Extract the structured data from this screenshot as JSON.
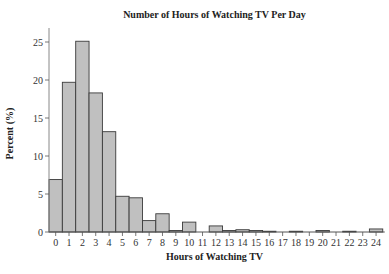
{
  "chart_data": {
    "type": "bar",
    "title": "Number of Hours of Watching TV Per Day",
    "xlabel": "Hours of Watching TV",
    "ylabel": "Percent (%)",
    "categories": [
      "0",
      "1",
      "2",
      "3",
      "4",
      "5",
      "6",
      "7",
      "8",
      "9",
      "10",
      "11",
      "12",
      "13",
      "14",
      "15",
      "16",
      "17",
      "18",
      "19",
      "20",
      "21",
      "22",
      "23",
      "24"
    ],
    "values": [
      6.9,
      19.7,
      25.1,
      18.3,
      13.2,
      4.7,
      4.5,
      1.5,
      2.4,
      0.2,
      1.3,
      0.0,
      0.8,
      0.2,
      0.3,
      0.2,
      0.1,
      0.0,
      0.1,
      0.0,
      0.2,
      0.0,
      0.1,
      0.0,
      0.4
    ],
    "ylim": [
      0,
      27
    ],
    "yticks": [
      0,
      5,
      10,
      15,
      20,
      25
    ],
    "grid": false,
    "legend": null,
    "bar_color": "#c0c0c0",
    "bar_edge_color": "#3a3a3a"
  }
}
